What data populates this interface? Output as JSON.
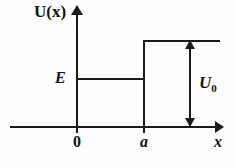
{
  "figure": {
    "kind": "potential-step-energy-diagram",
    "background_color": "#fdfdfd",
    "line_color": "#1b1b1b"
  },
  "axes": {
    "y_label": "U(x)",
    "x_label": "x",
    "ticks": [
      {
        "name": "origin",
        "label": "0",
        "x_px": 77
      },
      {
        "name": "barrier-edge",
        "label": "a",
        "x_px": 144
      }
    ]
  },
  "levels": {
    "energy_label": "E",
    "barrier_label": "U",
    "barrier_subscript": "0"
  },
  "chart_data": {
    "type": "line",
    "title": "",
    "xlabel": "x",
    "ylabel": "U(x)",
    "xlim": [
      -0.2,
      2.2
    ],
    "ylim": [
      0,
      1.15
    ],
    "grid": false,
    "legend": null,
    "x_tick_labels": [
      "0",
      "a"
    ],
    "x_tick_values": [
      0,
      1
    ],
    "series": [
      {
        "name": "U(x) potential step",
        "x": [
          0,
          1,
          1,
          2.05
        ],
        "values": [
          0,
          0,
          1,
          1
        ],
        "style": "step"
      },
      {
        "name": "E total energy level",
        "x": [
          0,
          1
        ],
        "values": [
          0.55,
          0.55
        ],
        "style": "horizontal-line"
      }
    ],
    "annotations": [
      {
        "text": "U(x)",
        "role": "y-axis-label"
      },
      {
        "text": "x",
        "role": "x-axis-label"
      },
      {
        "text": "E",
        "role": "energy-level-label",
        "y_value": 0.55
      },
      {
        "text": "U0",
        "role": "barrier-height-dimension",
        "from_y": 0,
        "to_y": 1
      },
      {
        "text": "0",
        "role": "x-tick",
        "x_value": 0
      },
      {
        "text": "a",
        "role": "x-tick",
        "x_value": 1
      }
    ]
  }
}
